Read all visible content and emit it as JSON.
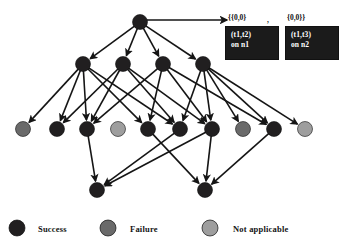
{
  "figure": {
    "title_annotation": {
      "left_set": "{{0,0}",
      "separator": ",",
      "right_set": "{0,0}}"
    },
    "annotations": [
      {
        "name": "annotation-box-1",
        "line1": "(t1,t2)",
        "line2": "on n1"
      },
      {
        "name": "annotation-box-2",
        "line1": "(t1,t3)",
        "line2": "on n2"
      }
    ]
  },
  "colors": {
    "success": "#211f20",
    "failure": "#6a6a6a",
    "not_applicable": "#9e9e9e",
    "edge": "#151515",
    "box_fill": "#1b1b1b",
    "box_text": "#ffffff",
    "background": "#ffffff"
  },
  "legend": {
    "items": [
      {
        "label": "Success",
        "status": "success",
        "color": "#211f20"
      },
      {
        "label": "Failure",
        "status": "failure",
        "color": "#6a6a6a"
      },
      {
        "label": "Not applicable",
        "status": "not_applicable",
        "color": "#9e9e9e"
      }
    ]
  },
  "graph": {
    "node_radius": 7.5,
    "nodes": [
      {
        "id": "r0",
        "x": 140,
        "y": 22,
        "status": "success",
        "row": 0
      },
      {
        "id": "r1a",
        "x": 83,
        "y": 64,
        "status": "success",
        "row": 1
      },
      {
        "id": "r1b",
        "x": 123,
        "y": 64,
        "status": "success",
        "row": 1
      },
      {
        "id": "r1c",
        "x": 163,
        "y": 64,
        "status": "success",
        "row": 1
      },
      {
        "id": "r1d",
        "x": 203,
        "y": 64,
        "status": "success",
        "row": 1
      },
      {
        "id": "r2a",
        "x": 23,
        "y": 129,
        "status": "failure",
        "row": 2
      },
      {
        "id": "r2b",
        "x": 57,
        "y": 129,
        "status": "success",
        "row": 2
      },
      {
        "id": "r2c",
        "x": 87,
        "y": 129,
        "status": "success",
        "row": 2
      },
      {
        "id": "r2d",
        "x": 118,
        "y": 129,
        "status": "not_applicable",
        "row": 2
      },
      {
        "id": "r2e",
        "x": 148,
        "y": 129,
        "status": "success",
        "row": 2
      },
      {
        "id": "r2f",
        "x": 180,
        "y": 129,
        "status": "success",
        "row": 2
      },
      {
        "id": "r2g",
        "x": 212,
        "y": 129,
        "status": "success",
        "row": 2
      },
      {
        "id": "r2h",
        "x": 243,
        "y": 129,
        "status": "failure",
        "row": 2
      },
      {
        "id": "r2i",
        "x": 274,
        "y": 129,
        "status": "success",
        "row": 2
      },
      {
        "id": "r2j",
        "x": 305,
        "y": 129,
        "status": "not_applicable",
        "row": 2
      },
      {
        "id": "r3a",
        "x": 97,
        "y": 190,
        "status": "success",
        "row": 3
      },
      {
        "id": "r3b",
        "x": 205,
        "y": 190,
        "status": "success",
        "row": 3
      }
    ],
    "edges": [
      {
        "from": "r0",
        "to": "r1a"
      },
      {
        "from": "r0",
        "to": "r1b"
      },
      {
        "from": "r0",
        "to": "r1c"
      },
      {
        "from": "r0",
        "to": "r1d"
      },
      {
        "from": "r1a",
        "to": "r2a"
      },
      {
        "from": "r1a",
        "to": "r2b"
      },
      {
        "from": "r1a",
        "to": "r2c"
      },
      {
        "from": "r1a",
        "to": "r2e"
      },
      {
        "from": "r1a",
        "to": "r2f"
      },
      {
        "from": "r1b",
        "to": "r2b"
      },
      {
        "from": "r1b",
        "to": "r2c"
      },
      {
        "from": "r1b",
        "to": "r2f"
      },
      {
        "from": "r1b",
        "to": "r2g"
      },
      {
        "from": "r1c",
        "to": "r2c"
      },
      {
        "from": "r1c",
        "to": "r2e"
      },
      {
        "from": "r1c",
        "to": "r2g"
      },
      {
        "from": "r1c",
        "to": "r2i"
      },
      {
        "from": "r1d",
        "to": "r2f"
      },
      {
        "from": "r1d",
        "to": "r2g"
      },
      {
        "from": "r1d",
        "to": "r2h"
      },
      {
        "from": "r1d",
        "to": "r2i"
      },
      {
        "from": "r1d",
        "to": "r2j"
      },
      {
        "from": "r2c",
        "to": "r3a"
      },
      {
        "from": "r2f",
        "to": "r3a"
      },
      {
        "from": "r2g",
        "to": "r3a"
      },
      {
        "from": "r2e",
        "to": "r3b"
      },
      {
        "from": "r2g",
        "to": "r3b"
      },
      {
        "from": "r2i",
        "to": "r3b"
      }
    ],
    "pointer_edge": {
      "from": "r0",
      "to_x": 227,
      "to_y": 20
    }
  }
}
